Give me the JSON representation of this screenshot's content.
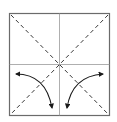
{
  "diagram": {
    "elements": {
      "paper": {
        "shape": "square"
      },
      "creases": [
        {
          "name": "vertical-crease",
          "style": "solid"
        },
        {
          "name": "horizontal-crease",
          "style": "solid"
        }
      ],
      "fold_lines": [
        {
          "name": "diagonal-fold-tl-br",
          "style": "dashed",
          "type": "valley"
        },
        {
          "name": "diagonal-fold-tr-bl",
          "style": "dashed",
          "type": "valley"
        }
      ],
      "arrows": [
        {
          "name": "left-fold-unfold-arrow",
          "kind": "fold-and-unfold",
          "side": "left"
        },
        {
          "name": "right-fold-unfold-arrow",
          "kind": "fold-and-unfold",
          "side": "right"
        }
      ]
    },
    "colors": {
      "paper_border": "#6b6b6b",
      "crease": "#9a9a9a",
      "fold_line": "#3a3a3a",
      "arrow": "#1a1a1a",
      "background": "#ffffff"
    }
  }
}
